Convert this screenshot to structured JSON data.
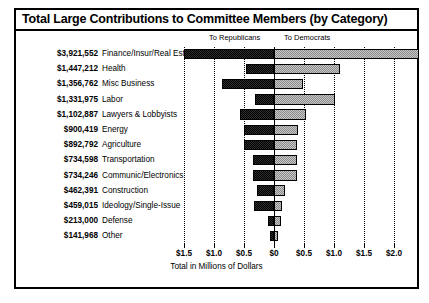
{
  "chart": {
    "title": "Total Large Contributions to Committee Members (by Category)",
    "axis_title": "Total in Millions of Dollars",
    "legend": {
      "left_label": "To Republicans",
      "right_label": "To Democrats"
    }
  },
  "chart_data": {
    "type": "bar",
    "orientation": "horizontal",
    "style": "diverging-stacked",
    "title": "Total Large Contributions to Committee Members (by Category)",
    "xlabel": "Total in Millions of Dollars",
    "ylabel": "",
    "xlim": [
      -1.5,
      2.0
    ],
    "xticks": [
      -1.5,
      -1.0,
      -0.5,
      0,
      0.5,
      1.0,
      1.5,
      2.0
    ],
    "xticklabels": [
      "$1.5",
      "$1.0",
      "$0.5",
      "$0",
      "$0.5",
      "$1.0",
      "$1.5",
      "$2.0"
    ],
    "grid": true,
    "legend_position": "top",
    "categories": [
      "Finance/Insur/Real Est",
      "Health",
      "Misc Business",
      "Labor",
      "Lawyers & Lobbyists",
      "Energy",
      "Agriculture",
      "Transportation",
      "Communic/Electronics",
      "Construction",
      "Ideology/Single-Issue",
      "Defense",
      "Other"
    ],
    "totals_labels": [
      "$3,921,552",
      "$1,447,212",
      "$1,356,762",
      "$1,331,975",
      "$1,102,887",
      "$900,419",
      "$892,792",
      "$734,598",
      "$734,246",
      "$462,391",
      "$459,015",
      "$213,000",
      "$141,968"
    ],
    "totals_values": [
      3921552,
      1447212,
      1356762,
      1331975,
      1102887,
      900419,
      892792,
      734598,
      734246,
      462391,
      459015,
      213000,
      141968
    ],
    "series": [
      {
        "name": "To Republicans",
        "direction": "left",
        "color": "#2e2e2e",
        "values": [
          1.5,
          0.47,
          0.87,
          0.32,
          0.57,
          0.5,
          0.5,
          0.35,
          0.35,
          0.28,
          0.33,
          0.1,
          0.07
        ]
      },
      {
        "name": "To Democrats",
        "direction": "right",
        "color": "#c8c8c8",
        "values": [
          2.42,
          1.1,
          0.49,
          1.01,
          0.53,
          0.4,
          0.39,
          0.38,
          0.38,
          0.18,
          0.13,
          0.11,
          0.07
        ]
      }
    ]
  }
}
